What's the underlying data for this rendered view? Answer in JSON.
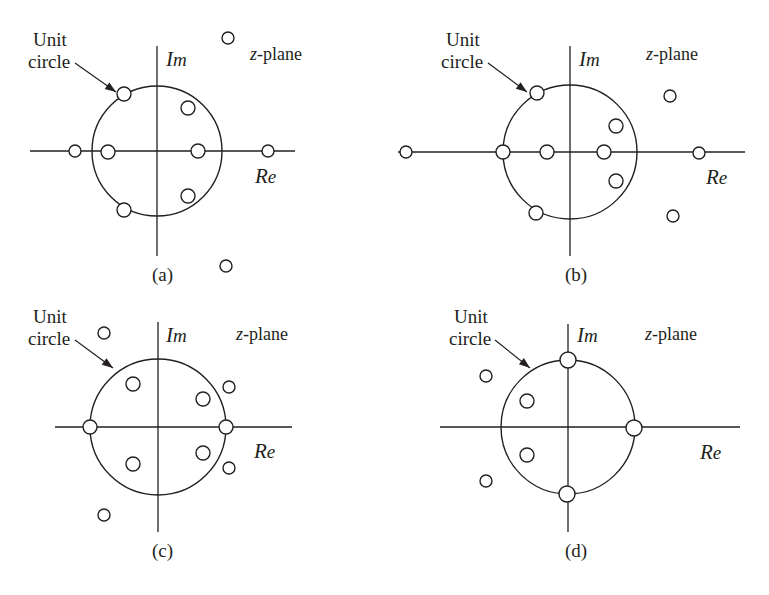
{
  "figure": {
    "title": "",
    "panels": [
      {
        "id": "a",
        "caption": "(a)",
        "unit_circle_label_line1": "Unit",
        "unit_circle_label_line2": "circle",
        "im_axis_label": "Im",
        "re_axis_label": "Re",
        "plane_label": "z-plane",
        "origin": {
          "x": 157,
          "y": 151
        },
        "radius": 65,
        "x_axis": {
          "x1": 30,
          "x2": 295
        },
        "y_axis": {
          "y1": 46,
          "y2": 256
        },
        "leader": {
          "x1": 75,
          "y1": 63,
          "x2": 116,
          "y2": 92
        },
        "markers": [
          {
            "name": "pole-on-circle-upper-left",
            "x": 124,
            "y": 94,
            "r": 7,
            "on_circle": true
          },
          {
            "name": "pole-inside-upper-right",
            "x": 188,
            "y": 108,
            "r": 7,
            "on_circle": false
          },
          {
            "name": "pole-outside-left-real",
            "x": 75,
            "y": 151,
            "r": 6,
            "on_circle": false
          },
          {
            "name": "pole-on-circle-left-real",
            "x": 108,
            "y": 152,
            "r": 7,
            "on_circle": true
          },
          {
            "name": "pole-inside-right-real",
            "x": 198,
            "y": 151,
            "r": 7,
            "on_circle": false
          },
          {
            "name": "pole-outside-right-real",
            "x": 268,
            "y": 151,
            "r": 6,
            "on_circle": false
          },
          {
            "name": "pole-inside-lower-right",
            "x": 188,
            "y": 196,
            "r": 7,
            "on_circle": false
          },
          {
            "name": "pole-on-circle-lower-left",
            "x": 124,
            "y": 210,
            "r": 7,
            "on_circle": true
          },
          {
            "name": "pole-outside-top",
            "x": 228,
            "y": 38,
            "r": 6,
            "on_circle": false
          },
          {
            "name": "pole-outside-bottom",
            "x": 226,
            "y": 266,
            "r": 6,
            "on_circle": false
          }
        ],
        "label_positions": {
          "unit_line1": {
            "x": 33,
            "y": 46
          },
          "unit_line2": {
            "x": 28,
            "y": 68
          },
          "im": {
            "x": 166,
            "y": 66
          },
          "re": {
            "x": 255,
            "y": 183
          },
          "plane": {
            "x": 250,
            "y": 60
          },
          "caption": {
            "x": 152,
            "y": 281
          }
        }
      },
      {
        "id": "b",
        "caption": "(b)",
        "unit_circle_label_line1": "Unit",
        "unit_circle_label_line2": "circle",
        "im_axis_label": "Im",
        "re_axis_label": "Re",
        "plane_label": "z-plane",
        "origin": {
          "x": 570,
          "y": 152
        },
        "radius": 67,
        "x_axis": {
          "x1": 398,
          "x2": 745
        },
        "y_axis": {
          "y1": 46,
          "y2": 256
        },
        "leader": {
          "x1": 488,
          "y1": 63,
          "x2": 527,
          "y2": 92
        },
        "markers": [
          {
            "name": "pole-on-circle-upper-left",
            "x": 537,
            "y": 93,
            "r": 7,
            "on_circle": true
          },
          {
            "name": "pole-inside-upper-right",
            "x": 616,
            "y": 126,
            "r": 7,
            "on_circle": false
          },
          {
            "name": "pole-outside-left-real",
            "x": 406,
            "y": 152,
            "r": 6,
            "on_circle": false
          },
          {
            "name": "pole-on-circle-left-real",
            "x": 503,
            "y": 152,
            "r": 7,
            "on_circle": true
          },
          {
            "name": "pole-inside-left-real",
            "x": 547,
            "y": 152,
            "r": 7,
            "on_circle": false
          },
          {
            "name": "pole-inside-right-real",
            "x": 604,
            "y": 152,
            "r": 7,
            "on_circle": false
          },
          {
            "name": "pole-outside-right-real",
            "x": 699,
            "y": 153,
            "r": 6,
            "on_circle": false
          },
          {
            "name": "pole-inside-lower-right",
            "x": 616,
            "y": 181,
            "r": 7,
            "on_circle": false
          },
          {
            "name": "pole-on-circle-lower-left",
            "x": 536,
            "y": 213,
            "r": 7,
            "on_circle": true
          },
          {
            "name": "pole-outside-upper-right",
            "x": 670,
            "y": 96,
            "r": 6,
            "on_circle": false
          },
          {
            "name": "pole-outside-lower-right",
            "x": 673,
            "y": 216,
            "r": 6,
            "on_circle": false
          }
        ],
        "label_positions": {
          "unit_line1": {
            "x": 446,
            "y": 46
          },
          "unit_line2": {
            "x": 441,
            "y": 68
          },
          "im": {
            "x": 579,
            "y": 66
          },
          "re": {
            "x": 706,
            "y": 184
          },
          "plane": {
            "x": 646,
            "y": 60
          },
          "caption": {
            "x": 565,
            "y": 281
          }
        }
      },
      {
        "id": "c",
        "caption": "(c)",
        "unit_circle_label_line1": "Unit",
        "unit_circle_label_line2": "circle",
        "im_axis_label": "Im",
        "re_axis_label": "Re",
        "plane_label": "z-plane",
        "origin": {
          "x": 158,
          "y": 427
        },
        "radius": 68,
        "x_axis": {
          "x1": 55,
          "x2": 292
        },
        "y_axis": {
          "y1": 322,
          "y2": 532
        },
        "leader": {
          "x1": 75,
          "y1": 340,
          "x2": 113,
          "y2": 368
        },
        "markers": [
          {
            "name": "pole-outside-upper-left",
            "x": 104,
            "y": 333,
            "r": 6,
            "on_circle": false
          },
          {
            "name": "pole-inside-upper-left",
            "x": 133,
            "y": 384,
            "r": 7,
            "on_circle": false
          },
          {
            "name": "pole-inside-upper-right",
            "x": 203,
            "y": 399,
            "r": 7,
            "on_circle": false
          },
          {
            "name": "pole-outside-upper-right",
            "x": 229,
            "y": 387,
            "r": 6,
            "on_circle": false
          },
          {
            "name": "pole-on-circle-left-real",
            "x": 90,
            "y": 427,
            "r": 7,
            "on_circle": true
          },
          {
            "name": "pole-on-circle-right-real",
            "x": 226,
            "y": 427,
            "r": 7,
            "on_circle": true
          },
          {
            "name": "pole-inside-lower-right",
            "x": 203,
            "y": 453,
            "r": 7,
            "on_circle": false
          },
          {
            "name": "pole-outside-lower-right",
            "x": 229,
            "y": 468,
            "r": 6,
            "on_circle": false
          },
          {
            "name": "pole-inside-lower-left",
            "x": 133,
            "y": 464,
            "r": 7,
            "on_circle": false
          },
          {
            "name": "pole-outside-lower-left",
            "x": 104,
            "y": 515,
            "r": 6,
            "on_circle": false
          }
        ],
        "label_positions": {
          "unit_line1": {
            "x": 33,
            "y": 323
          },
          "unit_line2": {
            "x": 28,
            "y": 345
          },
          "im": {
            "x": 166,
            "y": 342
          },
          "re": {
            "x": 254,
            "y": 458
          },
          "plane": {
            "x": 236,
            "y": 340
          },
          "caption": {
            "x": 152,
            "y": 557
          }
        }
      },
      {
        "id": "d",
        "caption": "(d)",
        "unit_circle_label_line1": "Unit",
        "unit_circle_label_line2": "circle",
        "im_axis_label": "Im",
        "re_axis_label": "Re",
        "plane_label": "z-plane",
        "origin": {
          "x": 568,
          "y": 427
        },
        "radius": 67,
        "x_axis": {
          "x1": 440,
          "x2": 740
        },
        "y_axis": {
          "y1": 324,
          "y2": 532
        },
        "leader": {
          "x1": 495,
          "y1": 340,
          "x2": 530,
          "y2": 368
        },
        "markers": [
          {
            "name": "pole-on-circle-top",
            "x": 568,
            "y": 360,
            "r": 8,
            "on_circle": true
          },
          {
            "name": "pole-outside-upper-left",
            "x": 486,
            "y": 376,
            "r": 6,
            "on_circle": false
          },
          {
            "name": "pole-inside-upper-left",
            "x": 527,
            "y": 401,
            "r": 7,
            "on_circle": false
          },
          {
            "name": "pole-on-circle-right-real",
            "x": 634,
            "y": 428,
            "r": 8,
            "on_circle": true
          },
          {
            "name": "pole-inside-lower-left",
            "x": 527,
            "y": 455,
            "r": 7,
            "on_circle": false
          },
          {
            "name": "pole-outside-lower-left",
            "x": 486,
            "y": 481,
            "r": 6,
            "on_circle": false
          },
          {
            "name": "pole-on-circle-bottom",
            "x": 567,
            "y": 494,
            "r": 8,
            "on_circle": true
          }
        ],
        "label_positions": {
          "unit_line1": {
            "x": 454,
            "y": 323
          },
          "unit_line2": {
            "x": 449,
            "y": 345
          },
          "im": {
            "x": 577,
            "y": 342
          },
          "re": {
            "x": 700,
            "y": 459
          },
          "plane": {
            "x": 645,
            "y": 340
          },
          "caption": {
            "x": 565,
            "y": 557
          }
        }
      }
    ],
    "colors": {
      "ink": "#231f20",
      "paper": "#ffffff",
      "marker_fill": "#ffffff"
    }
  }
}
